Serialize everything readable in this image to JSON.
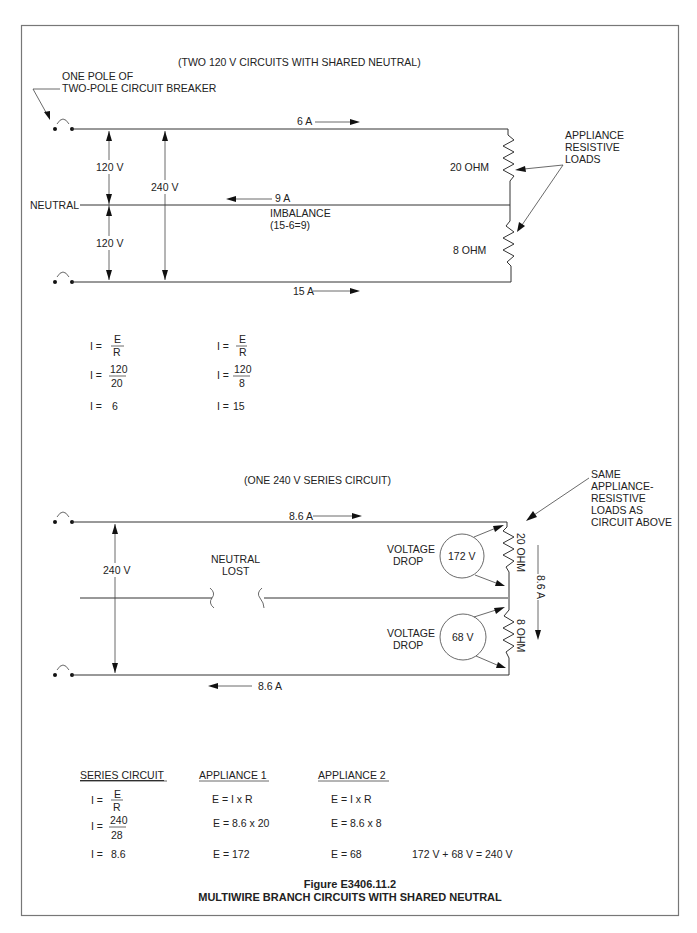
{
  "figure": {
    "number": "Figure E3406.11.2",
    "title": "MULTIWIRE BRANCH CIRCUITS WITH SHARED NEUTRAL"
  },
  "top_circuit": {
    "heading": "(TWO 120 V CIRCUITS WITH SHARED NEUTRAL)",
    "breaker_label_1": "ONE POLE OF",
    "breaker_label_2": "TWO-POLE CIRCUIT BREAKER",
    "current_top": "6 A",
    "current_bottom": "15 A",
    "current_neutral": "9 A",
    "imbalance_1": "IMBALANCE",
    "imbalance_2": "(15-6=9)",
    "neutral_label": "NEUTRAL",
    "voltage_upper": "120 V",
    "voltage_lower": "120 V",
    "voltage_total": "240 V",
    "load_upper": "20 OHM",
    "load_lower": "8 OHM",
    "loads_label_1": "APPLIANCE",
    "loads_label_2": "RESISTIVE",
    "loads_label_3": "LOADS"
  },
  "top_equations": {
    "left": {
      "prefix": "I =",
      "line1_num": "E",
      "line1_den": "R",
      "line2_num": "120",
      "line2_den": "20",
      "result": "6"
    },
    "right": {
      "prefix": "I =",
      "line1_num": "E",
      "line1_den": "R",
      "line2_num": "120",
      "line2_den": "8",
      "result": "15"
    }
  },
  "bottom_circuit": {
    "heading": "(ONE 240 V SERIES CIRCUIT)",
    "current_top": "8.6 A",
    "current_bottom": "8.6 A",
    "current_side": "8.6 A",
    "voltage_total": "240 V",
    "neutral_lost_1": "NEUTRAL",
    "neutral_lost_2": "LOST",
    "drop_label_1": "VOLTAGE",
    "drop_label_2": "DROP",
    "drop_upper": "172 V",
    "drop_lower": "68 V",
    "load_upper": "20 OHM",
    "load_lower": "8 OHM",
    "same_label_1": "SAME",
    "same_label_2": "APPLIANCE-",
    "same_label_3": "RESISTIVE",
    "same_label_4": "LOADS AS",
    "same_label_5": "CIRCUIT ABOVE"
  },
  "bottom_equations": {
    "series": {
      "header": "SERIES CIRCUIT",
      "prefix": "I =",
      "line1_num": "E",
      "line1_den": "R",
      "line2_num": "240",
      "line2_den": "28",
      "result": "8.6"
    },
    "appliance1": {
      "header": "APPLIANCE 1",
      "line1": "E = I x R",
      "line2": "E = 8.6 x 20",
      "line3": "E = 172"
    },
    "appliance2": {
      "header": "APPLIANCE 2",
      "line1": "E = I x R",
      "line2": "E = 8.6 x 8",
      "line3": "E = 68"
    },
    "total": "172 V + 68 V = 240 V"
  }
}
